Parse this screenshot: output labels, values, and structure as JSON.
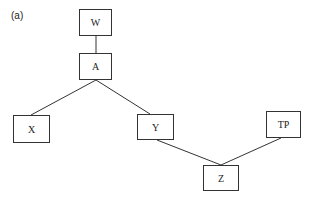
{
  "figure": {
    "label": "(a)",
    "nodes": [
      {
        "id": "W",
        "label": "W",
        "x": 79,
        "y": 9,
        "w": 33,
        "h": 27
      },
      {
        "id": "A",
        "label": "A",
        "x": 79,
        "y": 53,
        "w": 33,
        "h": 27
      },
      {
        "id": "X",
        "label": "X",
        "x": 13,
        "y": 115,
        "w": 37,
        "h": 28
      },
      {
        "id": "Y",
        "label": "Y",
        "x": 137,
        "y": 114,
        "w": 37,
        "h": 26
      },
      {
        "id": "TP",
        "label": "TP",
        "x": 266,
        "y": 111,
        "w": 35,
        "h": 27
      },
      {
        "id": "Z",
        "label": "Z",
        "x": 203,
        "y": 165,
        "w": 36,
        "h": 26
      }
    ],
    "edges": [
      {
        "from": "W",
        "to": "A"
      },
      {
        "from": "A",
        "to": "X"
      },
      {
        "from": "A",
        "to": "Y"
      },
      {
        "from": "Y",
        "to": "Z"
      },
      {
        "from": "TP",
        "to": "Z"
      }
    ]
  }
}
